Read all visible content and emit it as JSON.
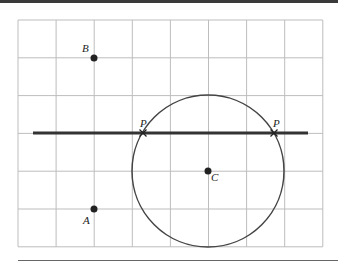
{
  "figure": {
    "grid": {
      "x0": 18,
      "y0": 20,
      "cols": 8,
      "rows": 6,
      "cell_w": 38.1,
      "cell_h": 37.8,
      "color": "#bdbdbd"
    },
    "line": {
      "x1": 33,
      "y1": 133,
      "x2": 308,
      "y2": 133,
      "color": "#333333"
    },
    "circle": {
      "cx": 208,
      "cy": 171,
      "r": 76,
      "color": "#444444"
    },
    "points": [
      {
        "name": "B",
        "label": "B",
        "x": 94,
        "y": 58,
        "lx": 82,
        "ly": 52
      },
      {
        "name": "A",
        "label": "A",
        "x": 94,
        "y": 209,
        "lx": 83,
        "ly": 224
      },
      {
        "name": "C",
        "label": "C",
        "x": 208,
        "y": 171,
        "lx": 211,
        "ly": 181
      }
    ],
    "intersections": [
      {
        "label": "P",
        "x": 143,
        "y": 133,
        "lx": 140,
        "ly": 127
      },
      {
        "label": "P",
        "x": 274,
        "y": 133,
        "lx": 273,
        "ly": 127
      }
    ]
  }
}
